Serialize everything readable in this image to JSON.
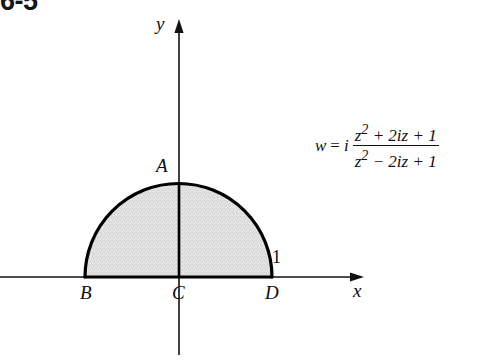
{
  "figure": {
    "number": "6-5",
    "background_color": "#ffffff",
    "stroke_color": "#000000",
    "region_fill_color": "#dcdcdc"
  },
  "axes": {
    "x_label": "x",
    "y_label": "y",
    "x_axis": {
      "y": 277,
      "x_start": 0,
      "x_end": 360
    },
    "y_axis": {
      "x": 179,
      "y_top": 22,
      "y_bottom": 355
    }
  },
  "region": {
    "shape": "upper half-disk",
    "center": {
      "x": 178.5,
      "y": 277
    },
    "radius": 93.5,
    "description": "shaded upper semicircular disk of radius 1 centered at the origin"
  },
  "points": {
    "A": {
      "label": "A",
      "position": "top of semicircle",
      "value": "i"
    },
    "B": {
      "label": "B",
      "position": "left end of diameter",
      "value": "-1"
    },
    "C": {
      "label": "C",
      "position": "origin",
      "value": "0"
    },
    "D": {
      "label": "D",
      "position": "right end of diameter",
      "value": "1"
    }
  },
  "tick": {
    "label": "1",
    "axis": "x"
  },
  "formula": {
    "lhs": "w",
    "equals": "=",
    "imaginary_unit": "i",
    "numerator": "z2 + 2iz + 1",
    "denominator": "z2 − 2iz + 1",
    "plain": "w = i (z² + 2iz + 1)/(z² − 2iz + 1)"
  }
}
